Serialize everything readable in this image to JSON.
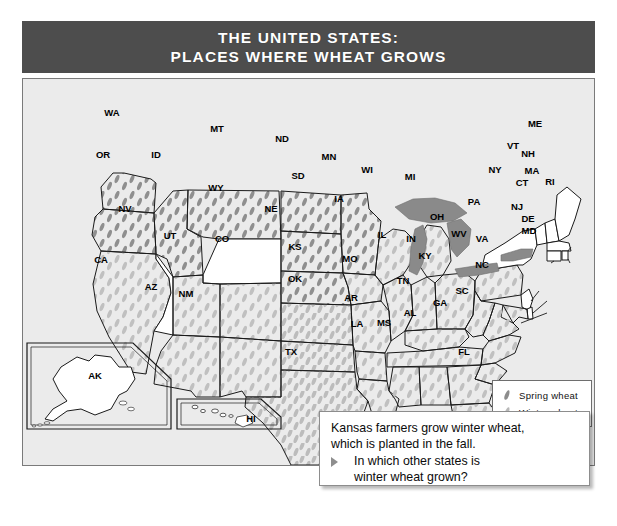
{
  "title": {
    "line1": "THE UNITED STATES:",
    "line2": "PLACES WHERE WHEAT GROWS"
  },
  "colors": {
    "title_bar": "#4d4d4d",
    "title_text": "#ffffff",
    "map_background": "#ebebeb",
    "state_fill": "#ffffff",
    "state_border": "#1a1a1a",
    "great_lakes": "#8a8a8a",
    "spring_wheat_mark": "#8c8c8c",
    "winter_wheat_mark": "#b8b8b8",
    "callout_border": "#8d8d8d"
  },
  "legend": {
    "title": "",
    "items": [
      {
        "label": "Spring wheat",
        "marker": "wheat-grain-dark",
        "color": "#8c8c8c"
      },
      {
        "label": "Winter wheat",
        "marker": "wheat-grain-light",
        "color": "#b8b8b8"
      }
    ]
  },
  "callout": {
    "statement_line1": "Kansas farmers grow winter wheat,",
    "statement_line2": "which is planted in the fall.",
    "bullet_icon": "triangle-right-icon",
    "question_line1": "In which other states is",
    "question_line2": "winter wheat grown?"
  },
  "map": {
    "insets": [
      {
        "id": "AK",
        "label": "AK"
      },
      {
        "id": "HI",
        "label": "HI"
      }
    ],
    "state_labels": [
      {
        "code": "WA",
        "x": 111,
        "y": 115
      },
      {
        "code": "OR",
        "x": 102,
        "y": 157
      },
      {
        "code": "ID",
        "x": 155,
        "y": 157
      },
      {
        "code": "MT",
        "x": 216,
        "y": 131
      },
      {
        "code": "ND",
        "x": 281,
        "y": 141
      },
      {
        "code": "SD",
        "x": 297,
        "y": 178
      },
      {
        "code": "MN",
        "x": 328,
        "y": 159
      },
      {
        "code": "WI",
        "x": 366,
        "y": 172
      },
      {
        "code": "MI",
        "x": 409,
        "y": 179
      },
      {
        "code": "WY",
        "x": 215,
        "y": 190
      },
      {
        "code": "NE",
        "x": 270,
        "y": 211
      },
      {
        "code": "IA",
        "x": 338,
        "y": 201
      },
      {
        "code": "NV",
        "x": 124,
        "y": 211
      },
      {
        "code": "UT",
        "x": 169,
        "y": 238
      },
      {
        "code": "CO",
        "x": 221,
        "y": 241
      },
      {
        "code": "KS",
        "x": 294,
        "y": 249
      },
      {
        "code": "MO",
        "x": 349,
        "y": 261
      },
      {
        "code": "IL",
        "x": 381,
        "y": 237
      },
      {
        "code": "IN",
        "x": 410,
        "y": 241
      },
      {
        "code": "KY",
        "x": 424,
        "y": 258
      },
      {
        "code": "OH",
        "x": 436,
        "y": 219
      },
      {
        "code": "PA",
        "x": 473,
        "y": 204
      },
      {
        "code": "NY",
        "x": 494,
        "y": 172
      },
      {
        "code": "WV",
        "x": 458,
        "y": 236
      },
      {
        "code": "VA",
        "x": 481,
        "y": 241
      },
      {
        "code": "NC",
        "x": 481,
        "y": 267
      },
      {
        "code": "SC",
        "x": 461,
        "y": 293
      },
      {
        "code": "GA",
        "x": 439,
        "y": 305
      },
      {
        "code": "FL",
        "x": 463,
        "y": 354
      },
      {
        "code": "TN",
        "x": 402,
        "y": 283
      },
      {
        "code": "AL",
        "x": 409,
        "y": 315
      },
      {
        "code": "MS",
        "x": 383,
        "y": 325
      },
      {
        "code": "LA",
        "x": 356,
        "y": 326
      },
      {
        "code": "AR",
        "x": 350,
        "y": 300
      },
      {
        "code": "OK",
        "x": 294,
        "y": 281
      },
      {
        "code": "TX",
        "x": 290,
        "y": 354
      },
      {
        "code": "NM",
        "x": 185,
        "y": 296
      },
      {
        "code": "AZ",
        "x": 150,
        "y": 289
      },
      {
        "code": "CA",
        "x": 100,
        "y": 262
      },
      {
        "code": "ME",
        "x": 534,
        "y": 126
      },
      {
        "code": "VT",
        "x": 512,
        "y": 148
      },
      {
        "code": "NH",
        "x": 527,
        "y": 156
      },
      {
        "code": "MA",
        "x": 531,
        "y": 173
      },
      {
        "code": "CT",
        "x": 521,
        "y": 185
      },
      {
        "code": "RI",
        "x": 549,
        "y": 184
      },
      {
        "code": "NJ",
        "x": 516,
        "y": 209
      },
      {
        "code": "DE",
        "x": 527,
        "y": 221
      },
      {
        "code": "MD",
        "x": 528,
        "y": 233
      }
    ]
  }
}
